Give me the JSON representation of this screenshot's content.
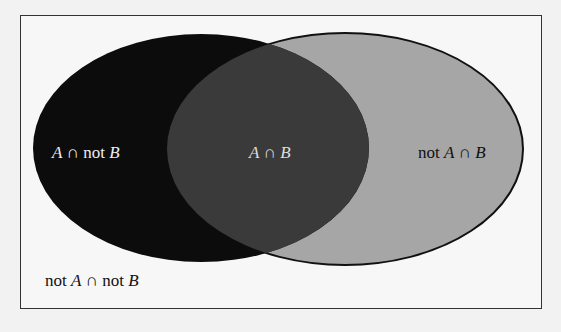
{
  "diagram": {
    "type": "venn",
    "sets": [
      "A",
      "B"
    ],
    "regions": {
      "a_not_b": {
        "label_parts": [
          "A",
          " ∩ not ",
          "B"
        ],
        "fill": "#0c0c0c"
      },
      "a_and_b": {
        "label_parts": [
          "A",
          " ∩ ",
          "B"
        ],
        "fill": "#3a3a3a"
      },
      "not_a_b": {
        "label_parts": [
          "not ",
          "A",
          " ∩ ",
          "B"
        ],
        "fill": "#a6a6a6"
      },
      "not_a_not_b": {
        "label_parts": [
          "not ",
          "A",
          " ∩ not ",
          "B"
        ],
        "fill": "#f7f7f7"
      }
    }
  }
}
